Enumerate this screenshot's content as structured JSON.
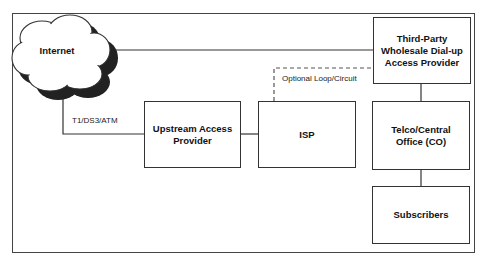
{
  "nodes": {
    "internet": "Internet",
    "third_party": "Third-Party Wholesale Dial-up Access Provider",
    "upstream": "Upstream Access Provider",
    "isp": "ISP",
    "telco": "Telco/Central Office (CO)",
    "subscribers": "Subscribers"
  },
  "labels": {
    "link_type": "T1/DS3/ATM",
    "optional": "Optional Loop/Circuit"
  }
}
